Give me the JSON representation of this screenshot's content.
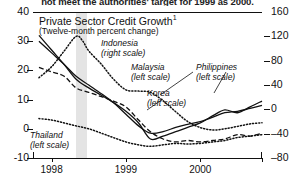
{
  "caption": "not meet the authorities' target for 1999 as 2000.",
  "chart_data": {
    "type": "line",
    "title": "Private Sector Credit Growth",
    "title_footnote": "1",
    "subtitle": "(Twelve-month percent change)",
    "xlabel": "",
    "ylabel_left": "",
    "ylabel_right": "",
    "xlim": [
      1997.75,
      2000.83
    ],
    "ylim_left": [
      -10,
      40
    ],
    "ylim_right": [
      -80,
      160
    ],
    "yticks_left": [
      40,
      30,
      20,
      10,
      0,
      -10
    ],
    "yticks_right": [
      160,
      120,
      80,
      40,
      0,
      -40,
      -80
    ],
    "xticks": [
      1998,
      1999,
      2000
    ],
    "xtick_labels": [
      "1998",
      "1999",
      "2000"
    ],
    "grid": false,
    "legend_position": "inline-annotations",
    "shaded_band": {
      "start": 1998.35,
      "end": 1998.5
    },
    "series": [
      {
        "name": "Indonesia",
        "scale": "right",
        "style": "dotted",
        "label": "Indonesia",
        "label_scale": "(right scale)",
        "x": [
          1997.83,
          1998.0,
          1998.17,
          1998.33,
          1998.42,
          1998.5,
          1998.67,
          1998.83,
          1999.0,
          1999.17,
          1999.33,
          1999.5,
          1999.67,
          1999.83,
          2000.0,
          2000.17,
          2000.33,
          2000.5,
          2000.67,
          2000.83
        ],
        "values": [
          52,
          70,
          96,
          120,
          112,
          96,
          74,
          50,
          32,
          30,
          28,
          14,
          -4,
          -20,
          -30,
          -34,
          -32,
          -28,
          -24,
          -22
        ]
      },
      {
        "name": "Thailand",
        "scale": "left",
        "style": "dotted",
        "label": "Thailand",
        "label_scale": "(left scale)",
        "x": [
          1997.83,
          1998.0,
          1998.17,
          1998.33,
          1998.5,
          1998.67,
          1998.83,
          1999.0,
          1999.17,
          1999.33,
          1999.5,
          1999.67,
          1999.83,
          2000.0,
          2000.17,
          2000.33,
          2000.5,
          2000.67,
          2000.83
        ],
        "values": [
          3.5,
          3.0,
          2.0,
          1.0,
          0.0,
          -1.5,
          -3.0,
          -4.5,
          -5.5,
          -6.0,
          -5.5,
          -5.0,
          -5.2,
          -5.0,
          -4.5,
          -4.0,
          -3.0,
          -2.5,
          -2.0
        ]
      },
      {
        "name": "Malaysia",
        "scale": "left",
        "style": "solid",
        "label": "Malaysia",
        "label_scale": "(left scale)",
        "x": [
          1997.83,
          1998.0,
          1998.17,
          1998.33,
          1998.5,
          1998.67,
          1998.83,
          1999.0,
          1999.17,
          1999.33,
          1999.5,
          1999.67,
          1999.83,
          2000.0,
          2000.17,
          2000.33,
          2000.5,
          2000.67,
          2000.83
        ],
        "values": [
          30,
          26,
          22,
          18,
          15,
          12,
          9,
          5,
          1,
          -1.5,
          -1.0,
          0.5,
          1.5,
          2.5,
          4.0,
          5.5,
          6.0,
          7.0,
          8.0
        ]
      },
      {
        "name": "Korea",
        "scale": "left",
        "style": "dashed",
        "label": "Korea",
        "label_scale": "(left scale)",
        "x": [
          1997.83,
          1998.0,
          1998.17,
          1998.33,
          1998.5,
          1998.67,
          1998.83,
          1999.0,
          1999.17,
          1999.33,
          1999.5,
          1999.67,
          1999.83,
          2000.0,
          2000.17,
          2000.33,
          2000.5,
          2000.67,
          2000.83
        ],
        "values": [
          21,
          19.5,
          18,
          14,
          12.5,
          11,
          9.5,
          7.5,
          3.0,
          -1.0,
          -3.5,
          -4.5,
          -4.0,
          -4.5,
          -4.0,
          -3.5,
          -2.0,
          -2.5,
          -1.5
        ]
      },
      {
        "name": "Philippines",
        "scale": "left",
        "style": "solid",
        "label": "Philippines",
        "label_scale": "(left scale)",
        "x": [
          1997.83,
          1998.0,
          1998.17,
          1998.33,
          1998.5,
          1998.67,
          1998.83,
          1999.0,
          1999.17,
          1999.33,
          1999.5,
          1999.67,
          1999.83,
          2000.0,
          2000.17,
          2000.33,
          2000.5,
          2000.67,
          2000.83
        ],
        "values": [
          32,
          27,
          22,
          17,
          14,
          11.5,
          9,
          6,
          2,
          -3.5,
          -2.5,
          -1.0,
          0.5,
          2.0,
          4.5,
          6.5,
          5.5,
          7.5,
          9.5
        ]
      }
    ]
  }
}
